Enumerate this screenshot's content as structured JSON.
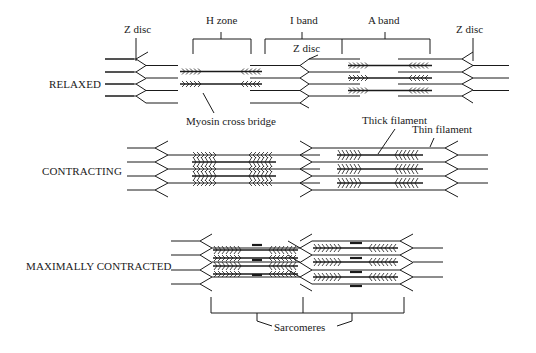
{
  "diagram": {
    "stages": [
      {
        "id": "relaxed",
        "label": "RELAXED"
      },
      {
        "id": "contracting",
        "label": "CONTRACTING"
      },
      {
        "id": "max",
        "label": "MAXIMALLY CONTRACTED"
      }
    ],
    "labels": {
      "z_disc_left": "Z disc",
      "h_zone": "H zone",
      "i_band": "I band",
      "a_band": "A band",
      "z_disc_mid": "Z disc",
      "z_disc_right": "Z disc",
      "myosin_cross_bridge": "Myosin cross bridge",
      "thick_filament": "Thick filament",
      "thin_filament": "Thin filament",
      "sarcomeres": "Sarcomeres"
    },
    "colors": {
      "line": "#1a1a1a",
      "background": "#ffffff"
    }
  }
}
